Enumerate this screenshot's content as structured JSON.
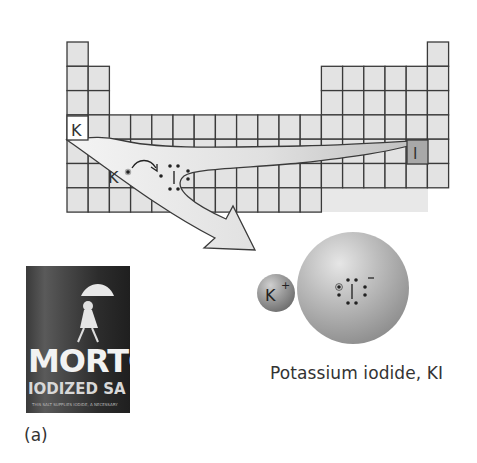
{
  "figure": {
    "panel_label": "(a)",
    "caption": "Potassium iodide, KI",
    "periodic_table": {
      "highlighted_elements": [
        {
          "symbol": "K",
          "group": 1,
          "period": 4,
          "fill": "#ffffff"
        },
        {
          "symbol": "I",
          "group": 17,
          "period": 5,
          "fill": "#a8a8a8"
        }
      ],
      "cell_fill": "#e3e3e3",
      "line_color": "#3a3a3a"
    },
    "lewis_reaction": {
      "left_atom": "K",
      "right_atom": "I",
      "arrow": "electron transfer arrow"
    },
    "ions": {
      "cation": {
        "symbol": "K",
        "charge": "+"
      },
      "anion": {
        "symbol": "I",
        "charge": "−"
      }
    },
    "photo": {
      "brand": "MORTO",
      "subtitle": "IODIZED SA",
      "fine_print": "THIS SALT SUPPLIES IODIDE, A NECESSARY"
    }
  }
}
